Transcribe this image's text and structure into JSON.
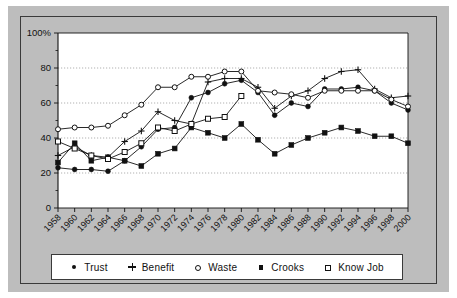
{
  "chart_data": {
    "type": "line",
    "title": "",
    "xlabel": "",
    "ylabel": "",
    "ylim": [
      0,
      100
    ],
    "y_ticks": [
      0,
      20,
      40,
      60,
      80,
      100
    ],
    "y_tick_labels": [
      "0",
      "20",
      "40",
      "60",
      "80",
      "100%"
    ],
    "y_minor_ticks": [
      10,
      30,
      50,
      70,
      90
    ],
    "grid": "horizontal-major-dotted",
    "legend_position": "below-axes",
    "categories": [
      1958,
      1960,
      1962,
      1964,
      1966,
      1968,
      1970,
      1972,
      1974,
      1976,
      1978,
      1980,
      1982,
      1984,
      1986,
      1988,
      1990,
      1992,
      1994,
      1996,
      1998,
      2000
    ],
    "x_tick_labels": [
      "1958",
      "1960",
      "1962",
      "1964",
      "1966",
      "1968",
      "1970",
      "1972",
      "1974",
      "1976",
      "1978",
      "1980",
      "1982",
      "1984",
      "1986",
      "1988",
      "1990",
      "1992",
      "1994",
      "1996",
      "1998",
      "2000"
    ],
    "series": [
      {
        "name": "Trust",
        "marker": "filled-circle",
        "values": [
          23,
          22,
          22,
          21,
          27,
          35,
          45,
          46,
          63,
          66,
          71,
          73,
          66,
          53,
          60,
          58,
          68,
          68,
          69,
          67,
          60,
          56
        ]
      },
      {
        "name": "Benefit",
        "marker": "plus",
        "values": [
          30,
          35,
          30,
          29,
          38,
          44,
          55,
          50,
          48,
          72,
          74,
          74,
          69,
          57,
          64,
          67,
          74,
          78,
          79,
          68,
          63,
          64
        ]
      },
      {
        "name": "Waste",
        "marker": "open-circle",
        "values": [
          45,
          46,
          46,
          47,
          53,
          59,
          69,
          69,
          75,
          75,
          78,
          78,
          67,
          66,
          65,
          63,
          67,
          67,
          67,
          67,
          62,
          58
        ]
      },
      {
        "name": "Crooks",
        "marker": "filled-square",
        "values": [
          26,
          37,
          27,
          29,
          27,
          24,
          31,
          34,
          46,
          43,
          40,
          48,
          39,
          31,
          36,
          40,
          43,
          46,
          44,
          41,
          41,
          37
        ]
      },
      {
        "name": "Know Job",
        "marker": "open-square",
        "values": [
          38,
          34,
          30,
          28,
          32,
          37,
          46,
          44,
          48,
          51,
          52,
          64,
          null,
          null,
          null,
          null,
          null,
          null,
          null,
          null,
          null,
          null
        ]
      }
    ]
  },
  "legend": {
    "items": [
      {
        "label": "Trust",
        "marker": "filled-circle-marker"
      },
      {
        "label": "Benefit",
        "marker": "plus-marker"
      },
      {
        "label": "Waste",
        "marker": "open-circle-marker"
      },
      {
        "label": "Crooks",
        "marker": "filled-square-marker"
      },
      {
        "label": "Know Job",
        "marker": "open-square-marker"
      }
    ]
  },
  "colors": {
    "figure_background": "#bdbdbd",
    "plot_background": "#ffffff",
    "ink": "#111111",
    "grid": "#8f8f8f",
    "frame": "#3a3a3a"
  }
}
